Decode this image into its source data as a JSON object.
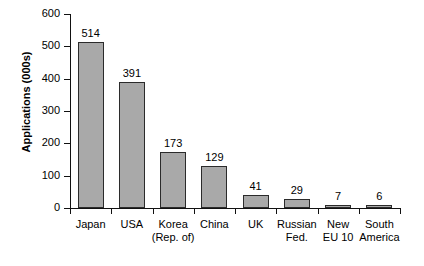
{
  "chart_data": {
    "type": "bar",
    "title": "",
    "subtitle": "",
    "xlabel": "",
    "ylabel": "Applications (000s)",
    "categories": [
      "Japan",
      "USA",
      "Korea (Rep. of)",
      "China",
      "UK",
      "Russian Fed.",
      "New EU 10",
      "South America"
    ],
    "category_lines": [
      [
        "Japan",
        ""
      ],
      [
        "USA",
        ""
      ],
      [
        "Korea",
        "(Rep. of)"
      ],
      [
        "China",
        ""
      ],
      [
        "UK",
        ""
      ],
      [
        "Russian",
        "Fed."
      ],
      [
        "New",
        "EU 10"
      ],
      [
        "South",
        "America"
      ]
    ],
    "values": [
      514,
      391,
      173,
      129,
      41,
      29,
      7,
      6
    ],
    "value_labels": [
      "514",
      "391",
      "173",
      "129",
      "41",
      "29",
      "7",
      "6"
    ],
    "ylim": [
      0,
      600
    ],
    "yticks": [
      0,
      100,
      200,
      300,
      400,
      500,
      600
    ],
    "ytick_labels": [
      "0",
      "100",
      "200",
      "300",
      "400",
      "500",
      "600"
    ],
    "grid": false,
    "legend": false,
    "legend_position": "none",
    "bar_color": "#a9a9a9",
    "bar_border_color": "#2b2b2b",
    "axis_color": "#111111",
    "background_color": "#ffffff"
  }
}
